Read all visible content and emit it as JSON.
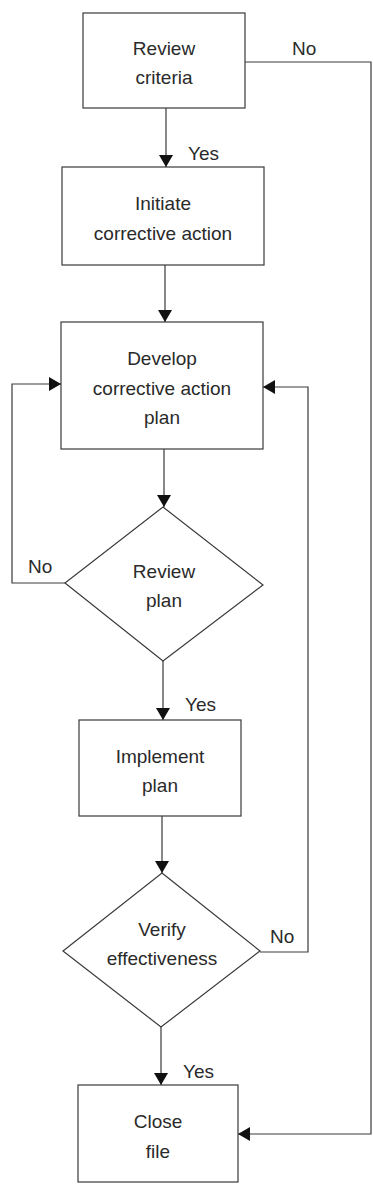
{
  "diagram": {
    "type": "flowchart",
    "nodes": [
      {
        "id": "review_criteria",
        "shape": "rect",
        "lines": [
          "Review",
          "criteria"
        ]
      },
      {
        "id": "initiate",
        "shape": "rect",
        "lines": [
          "Initiate",
          "corrective action"
        ]
      },
      {
        "id": "develop",
        "shape": "rect",
        "lines": [
          "Develop",
          "corrective action",
          "plan"
        ]
      },
      {
        "id": "review_plan",
        "shape": "diamond",
        "lines": [
          "Review",
          "plan"
        ]
      },
      {
        "id": "implement",
        "shape": "rect",
        "lines": [
          "Implement",
          "plan"
        ]
      },
      {
        "id": "verify",
        "shape": "diamond",
        "lines": [
          "Verify",
          "effectiveness"
        ]
      },
      {
        "id": "close",
        "shape": "rect",
        "lines": [
          "Close",
          "file"
        ]
      }
    ],
    "edges": [
      {
        "from": "review_criteria",
        "to": "initiate",
        "label": "Yes"
      },
      {
        "from": "review_criteria",
        "to": "close",
        "label": "No"
      },
      {
        "from": "initiate",
        "to": "develop",
        "label": ""
      },
      {
        "from": "develop",
        "to": "review_plan",
        "label": ""
      },
      {
        "from": "review_plan",
        "to": "develop",
        "label": "No"
      },
      {
        "from": "review_plan",
        "to": "implement",
        "label": "Yes"
      },
      {
        "from": "implement",
        "to": "verify",
        "label": ""
      },
      {
        "from": "verify",
        "to": "develop",
        "label": "No"
      },
      {
        "from": "verify",
        "to": "close",
        "label": "Yes"
      }
    ],
    "labels": {
      "yes": "Yes",
      "no": "No"
    },
    "colors": {
      "stroke": "#3a3a3a",
      "arrow": "#111111",
      "text": "#2a2a2a",
      "background": "#ffffff"
    }
  }
}
